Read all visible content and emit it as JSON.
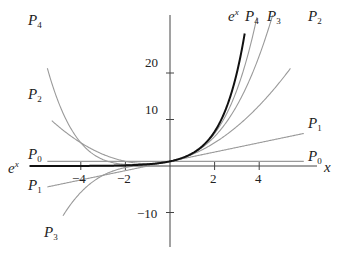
{
  "chart_data": {
    "type": "line",
    "title": "",
    "xlabel": "x",
    "ylabel": "",
    "xlim": [
      -6.3,
      6.6
    ],
    "ylim": [
      -15,
      33
    ],
    "x_ticks": [
      -4,
      -2,
      2,
      4
    ],
    "y_ticks": [
      -10,
      10,
      20
    ],
    "x_tick_labels": [
      "−4",
      "−2",
      "2",
      "4"
    ],
    "y_tick_labels": [
      "−10",
      "10",
      "20"
    ],
    "grid": false,
    "legend": "inline labels at curve ends",
    "series": [
      {
        "name": "e^x",
        "formula": "exp(x)",
        "color": "#111111",
        "width": 2.0,
        "x_range": [
          -6.3,
          3.35
        ]
      },
      {
        "name": "P0",
        "formula": "1",
        "color": "#9a9a9a",
        "x_range": [
          -5.5,
          6.0
        ]
      },
      {
        "name": "P1",
        "formula": "1+x",
        "color": "#9a9a9a",
        "x_range": [
          -5.5,
          6.0
        ]
      },
      {
        "name": "P2",
        "formula": "1+x+x^2/2",
        "color": "#9a9a9a",
        "x_range": [
          -5.3,
          5.4
        ]
      },
      {
        "name": "P3",
        "formula": "1+x+x^2/2+x^3/6",
        "color": "#9a9a9a",
        "x_range": [
          -4.8,
          4.6
        ]
      },
      {
        "name": "P4",
        "formula": "1+x+x^2/2+x^3/6+x^4/24",
        "color": "#9a9a9a",
        "x_range": [
          -5.5,
          3.9
        ]
      }
    ],
    "sample_values": {
      "x": [
        -4,
        -2,
        0,
        2,
        4
      ],
      "e^x": [
        0.02,
        0.14,
        1,
        7.39,
        54.6
      ],
      "P0": [
        1,
        1,
        1,
        1,
        1
      ],
      "P1": [
        -3,
        -1,
        1,
        3,
        5
      ],
      "P2": [
        5,
        1,
        1,
        5,
        13
      ],
      "P3": [
        -5.67,
        -0.33,
        1,
        6.33,
        23.67
      ],
      "P4": [
        5,
        0.33,
        1,
        7,
        34.33
      ]
    }
  },
  "labels": {
    "left": {
      "P4": {
        "base": "P",
        "sub": "4"
      },
      "P2": {
        "base": "P",
        "sub": "2"
      },
      "P0": {
        "base": "P",
        "sub": "0"
      },
      "ex": {
        "base": "e",
        "sup": "x"
      },
      "P1": {
        "base": "P",
        "sub": "1"
      },
      "P3": {
        "base": "P",
        "sub": "3"
      }
    },
    "right": {
      "ex": {
        "base": "e",
        "sup": "x"
      },
      "P4": {
        "base": "P",
        "sub": "4"
      },
      "P3": {
        "base": "P",
        "sub": "3"
      },
      "P2": {
        "base": "P",
        "sub": "2"
      },
      "P1": {
        "base": "P",
        "sub": "1"
      },
      "P0": {
        "base": "P",
        "sub": "0"
      }
    },
    "x_axis": "x"
  },
  "axis_ticks": {
    "x": [
      "−4",
      "−2",
      "2",
      "4"
    ],
    "y": [
      "20",
      "10",
      "−10"
    ]
  }
}
